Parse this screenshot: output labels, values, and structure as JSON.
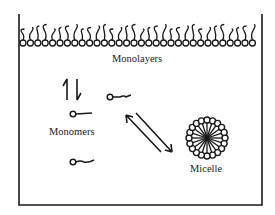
{
  "diagram": {
    "type": "micelle-equilibrium",
    "labels": {
      "monolayers": "Monolayers",
      "monomers": "Monomers",
      "micelle": "Micelle"
    },
    "colors": {
      "stroke": "#1a1a1a",
      "background": "#ffffff"
    },
    "elements": {
      "container": "open-top beaker outline",
      "monolayer": "row of surfactant molecules at surface, heads down, tails up",
      "monomer_count": 3,
      "arrows": [
        "vertical equilibrium (monolayer ↔ monomers)",
        "diagonal equilibrium (monomers ↔ micelle)"
      ],
      "micelle": "spherical aggregate, heads outward, tails inward"
    }
  }
}
